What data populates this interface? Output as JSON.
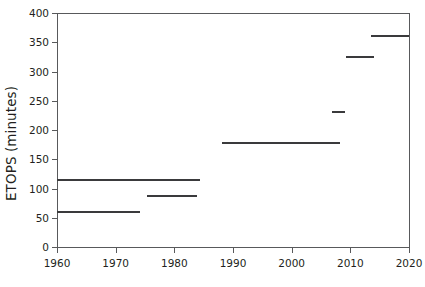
{
  "chart_data": {
    "type": "line",
    "title": "",
    "xlabel": "",
    "ylabel": "ETOPS (minutes)",
    "xlim": [
      1960,
      2020
    ],
    "ylim": [
      0,
      400
    ],
    "x_ticks": [
      1960,
      1970,
      1980,
      1990,
      2000,
      2010,
      2020
    ],
    "y_ticks": [
      0,
      50,
      100,
      150,
      200,
      250,
      300,
      350,
      400
    ],
    "grid": false,
    "legend": null,
    "style": "step-segments",
    "series": [
      {
        "name": "ETOPS limit",
        "color": "#3a3a3c",
        "segments": [
          {
            "label": "60-minute rule",
            "x_start": 1960.0,
            "x_end": 1974.2,
            "value": 60
          },
          {
            "label": "90-minute rule",
            "x_start": 1975.3,
            "x_end": 1983.9,
            "value": 88
          },
          {
            "label": "120-minute ETOPS",
            "x_start": 1984.4,
            "x_end": 1188.1,
            "value": 115
          },
          {
            "label": "180-minute ETOPS",
            "x_start": 1988.1,
            "x_end": 2008.2,
            "value": 177
          },
          {
            "label": "240-minute ETOPS",
            "x_start": 2006.9,
            "x_end": 2009.1,
            "value": 230
          },
          {
            "label": "330-minute ETOPS",
            "x_start": 2009.3,
            "x_end": 2014.0,
            "value": 325
          },
          {
            "label": "370-minute ETOPS",
            "x_start": 2013.5,
            "x_end": 2020.0,
            "value": 360
          }
        ]
      }
    ]
  },
  "axes": {
    "y_title": "ETOPS (minutes)",
    "y_tick_labels": [
      "400",
      "350",
      "300",
      "250",
      "200",
      "150",
      "100",
      "50",
      "0"
    ],
    "x_tick_labels": [
      "1960",
      "1970",
      "1980",
      "1990",
      "2000",
      "2010",
      "2020"
    ]
  },
  "colors": {
    "axis": "#58595b",
    "text": "#231f20",
    "data": "#3a3a3c",
    "background": "#ffffff"
  }
}
